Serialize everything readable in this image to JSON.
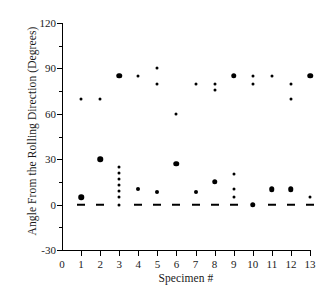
{
  "chart_data": {
    "type": "scatter",
    "title": "",
    "xlabel": "Specimen #",
    "ylabel": "Angle From the Rolling Direction (Degrees)",
    "xlim": [
      0,
      13
    ],
    "ylim": [
      -30,
      120
    ],
    "xticks": [
      0,
      1,
      2,
      3,
      4,
      5,
      6,
      7,
      8,
      9,
      10,
      11,
      12,
      13
    ],
    "xtick_labels": [
      "0",
      "1",
      "2",
      "3",
      "4",
      "5",
      "6",
      "7",
      "8",
      "9",
      "10",
      "11",
      "12",
      "13"
    ],
    "yticks": [
      -30,
      0,
      30,
      60,
      90,
      120
    ],
    "ytick_labels": [
      "-30",
      "0",
      "30",
      "60",
      "90",
      "120"
    ],
    "y_minor_ticks": [
      -15,
      15,
      45,
      75,
      105
    ],
    "grid": false,
    "legend": false,
    "marker_color": "#000000",
    "axis_color": "#000000",
    "series": [
      {
        "name": "Specimen 1",
        "x": 1,
        "points": [
          {
            "y": 70,
            "size": "sm"
          },
          {
            "y": 5,
            "size": "lg"
          },
          {
            "y": 0,
            "size": "dash"
          }
        ]
      },
      {
        "name": "Specimen 2",
        "x": 2,
        "points": [
          {
            "y": 70,
            "size": "sm"
          },
          {
            "y": 30,
            "size": "lg"
          },
          {
            "y": 0,
            "size": "dash"
          }
        ]
      },
      {
        "name": "Specimen 3",
        "x": 3,
        "points": [
          {
            "y": 85,
            "size": "lg"
          },
          {
            "y": 25,
            "size": "sm"
          },
          {
            "y": 21,
            "size": "sm"
          },
          {
            "y": 17,
            "size": "sm"
          },
          {
            "y": 13,
            "size": "sm"
          },
          {
            "y": 9,
            "size": "sm"
          },
          {
            "y": 5,
            "size": "sm"
          },
          {
            "y": 0,
            "size": "sm"
          }
        ]
      },
      {
        "name": "Specimen 4",
        "x": 4,
        "points": [
          {
            "y": 85,
            "size": "sm"
          },
          {
            "y": 10,
            "size": "md"
          },
          {
            "y": 0,
            "size": "dash"
          }
        ]
      },
      {
        "name": "Specimen 5",
        "x": 5,
        "points": [
          {
            "y": 90,
            "size": "sm"
          },
          {
            "y": 80,
            "size": "sm"
          },
          {
            "y": 8,
            "size": "md"
          },
          {
            "y": 0,
            "size": "dash"
          }
        ]
      },
      {
        "name": "Specimen 6",
        "x": 6,
        "points": [
          {
            "y": 60,
            "size": "sm"
          },
          {
            "y": 27,
            "size": "lg"
          },
          {
            "y": 0,
            "size": "dash"
          }
        ]
      },
      {
        "name": "Specimen 7",
        "x": 7,
        "points": [
          {
            "y": 80,
            "size": "sm"
          },
          {
            "y": 8,
            "size": "md"
          },
          {
            "y": 0,
            "size": "dash"
          }
        ]
      },
      {
        "name": "Specimen 8",
        "x": 8,
        "points": [
          {
            "y": 80,
            "size": "sm"
          },
          {
            "y": 76,
            "size": "sm"
          },
          {
            "y": 15,
            "size": "lg"
          },
          {
            "y": 0,
            "size": "dash"
          }
        ]
      },
      {
        "name": "Specimen 9",
        "x": 9,
        "points": [
          {
            "y": 85,
            "size": "lg"
          },
          {
            "y": 20,
            "size": "sm"
          },
          {
            "y": 10,
            "size": "sm"
          },
          {
            "y": 5,
            "size": "sm"
          },
          {
            "y": 0,
            "size": "dash"
          }
        ]
      },
      {
        "name": "Specimen 10",
        "x": 10,
        "points": [
          {
            "y": 85,
            "size": "sm"
          },
          {
            "y": 80,
            "size": "sm"
          },
          {
            "y": 0,
            "size": "lg"
          }
        ]
      },
      {
        "name": "Specimen 11",
        "x": 11,
        "points": [
          {
            "y": 85,
            "size": "sm"
          },
          {
            "y": 10,
            "size": "lg"
          },
          {
            "y": 0,
            "size": "dash"
          }
        ]
      },
      {
        "name": "Specimen 12",
        "x": 12,
        "points": [
          {
            "y": 80,
            "size": "sm"
          },
          {
            "y": 70,
            "size": "sm"
          },
          {
            "y": 10,
            "size": "lg"
          },
          {
            "y": 0,
            "size": "dash"
          }
        ]
      },
      {
        "name": "Specimen 13",
        "x": 13,
        "points": [
          {
            "y": 85,
            "size": "lg"
          },
          {
            "y": 5,
            "size": "sm"
          },
          {
            "y": 0,
            "size": "dash"
          }
        ]
      }
    ]
  }
}
